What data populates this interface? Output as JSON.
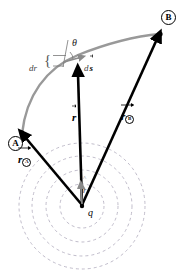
{
  "figure": {
    "background_color": "#ffffff",
    "width": 188,
    "height": 274
  },
  "colors": {
    "vector_black": "#000000",
    "path_gray": "#999999",
    "unit_vector_gray": "#8a8a8a",
    "dashed_circle": "#b9b4c4",
    "annotation_gray": "#777777",
    "label_black": "#000000"
  },
  "charge": {
    "symbol": "q",
    "center_x": 82,
    "center_y": 206,
    "dot_radius": 2.2
  },
  "endpoints": [
    {
      "name": "A",
      "label": "A",
      "marker": "circled-letter",
      "point_x": 22,
      "point_y": 133,
      "circle_x": 14,
      "circle_y": 143,
      "circle_d": 13
    },
    {
      "name": "B",
      "label": "B",
      "marker": "circled-letter",
      "point_x": 160,
      "point_y": 34,
      "circle_x": 162,
      "circle_y": 16,
      "circle_d": 13
    }
  ],
  "vectors": [
    {
      "id": "r_A",
      "label_base": "r",
      "label_sub": "A",
      "label_sub_circled": true,
      "has_overarrow": true,
      "from": {
        "x": 82,
        "y": 206
      },
      "to": {
        "x": 24,
        "y": 136
      },
      "color": "#000000",
      "label_x": 20,
      "label_y": 155
    },
    {
      "id": "r",
      "label_base": "r",
      "label_sub": "",
      "label_sub_circled": false,
      "has_overarrow": true,
      "from": {
        "x": 82,
        "y": 206
      },
      "to": {
        "x": 78,
        "y": 72
      },
      "color": "#000000",
      "label_x": 74,
      "label_y": 113
    },
    {
      "id": "r_B",
      "label_base": "r",
      "label_sub": "B",
      "label_sub_circled": true,
      "has_overarrow": true,
      "from": {
        "x": 82,
        "y": 206
      },
      "to": {
        "x": 158,
        "y": 37
      },
      "color": "#000000",
      "label_x": 123,
      "label_y": 112
    },
    {
      "id": "r_hat",
      "label_base": "r",
      "label_sub": "",
      "label_sub_circled": false,
      "has_hat": true,
      "from": {
        "x": 82,
        "y": 204
      },
      "to": {
        "x": 81,
        "y": 186
      },
      "color": "#8a8a8a",
      "label_x": 84,
      "label_y": 184
    },
    {
      "id": "ds",
      "label_base": "s",
      "label_prefix": "d",
      "has_overarrow": true,
      "from": {
        "x": 66,
        "y": 61
      },
      "to": {
        "x": 82,
        "y": 57
      },
      "color": "#8a8a8a",
      "label_x": 85,
      "label_y": 62
    }
  ],
  "path": {
    "id": "path-A-to-B",
    "description": "curved gray trajectory from A to B",
    "color": "#999999",
    "stroke_width": 2.4,
    "d": "M 22 134 C 26 96, 46 68, 78 55 C 108 43, 138 36, 160 34"
  },
  "equipotential_circles": {
    "description": "concentric dashed circles centered on the charge",
    "color": "#b9b4c4",
    "dash": "3,3",
    "stroke_width": 0.9,
    "radii": [
      22,
      36,
      50,
      63
    ]
  },
  "annotations": {
    "dr": {
      "label": "dr",
      "x": 31,
      "y": 70,
      "italic": true
    },
    "brace": {
      "label": "{",
      "x": 45,
      "y": 62
    },
    "theta": {
      "label": "θ",
      "x": 73,
      "y": 44,
      "italic": true
    },
    "radial_guide": {
      "description": "thin gray line showing the radial (outward) direction at the sample point",
      "from": {
        "x": 68,
        "y": 42
      },
      "to": {
        "x": 64,
        "y": 66
      },
      "color": "#777777"
    },
    "dr_tick_top": {
      "from": {
        "x": 52,
        "y": 56
      },
      "to": {
        "x": 66,
        "y": 56
      },
      "color": "#777777"
    },
    "dr_tick_bottom": {
      "from": {
        "x": 52,
        "y": 66
      },
      "to": {
        "x": 64,
        "y": 66
      },
      "color": "#777777"
    },
    "theta_arc": {
      "description": "small arc marking the angle between r-hat and ds",
      "cx": 66,
      "cy": 62,
      "r": 13
    }
  },
  "path_arrow_on_curve": {
    "description": "black arrowhead of the r vector touching the path",
    "x": 78,
    "y": 72
  }
}
